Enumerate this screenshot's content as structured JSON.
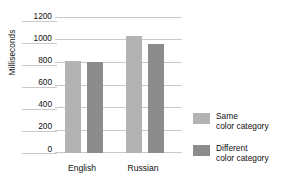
{
  "chart_data": {
    "type": "bar",
    "title": "",
    "xlabel": "",
    "ylabel": "Milliseconds",
    "categories": [
      "English",
      "Russian"
    ],
    "series": [
      {
        "name": "Same color category",
        "color": "#b3b3b3",
        "values": [
          820,
          1040
        ]
      },
      {
        "name": "Different color category",
        "color": "#8c8c8c",
        "values": [
          810,
          970
        ]
      }
    ],
    "ylim": [
      0,
      1200
    ],
    "yticks": [
      1200,
      1000,
      800,
      600,
      400,
      200,
      0
    ],
    "grid": true,
    "legend_position": "right"
  },
  "legend": {
    "items": [
      {
        "line1": "Same",
        "line2": "color category",
        "swatch": "legend-swatch-same"
      },
      {
        "line1": "Different",
        "line2": "color category",
        "swatch": "legend-swatch-different"
      }
    ]
  },
  "axis": {
    "y_title": "Milliseconds",
    "y_tick_0": "1200",
    "y_tick_1": "1000",
    "y_tick_2": "800",
    "y_tick_3": "600",
    "y_tick_4": "400",
    "y_tick_5": "200",
    "y_tick_6": "0",
    "x_cat_0": "English",
    "x_cat_1": "Russian"
  },
  "title": {
    "text": ""
  }
}
